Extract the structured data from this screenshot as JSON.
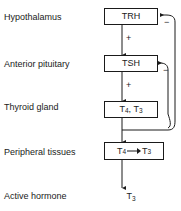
{
  "diagram": {
    "type": "flowchart",
    "rows": [
      {
        "label": "Hypothalamus",
        "node": "TRH"
      },
      {
        "label": "Anterior pituitary",
        "node": "TSH"
      },
      {
        "label": "Thyroid gland",
        "node": "T4, T3"
      },
      {
        "label": "Peripheral tissues",
        "node": "T4 → T3"
      },
      {
        "label": "Active hormone",
        "node": "T3"
      }
    ],
    "labels": {
      "hypothalamus": "Hypothalamus",
      "anterior_pituitary": "Anterior pituitary",
      "thyroid_gland": "Thyroid gland",
      "peripheral_tissues": "Peripheral tissues",
      "active_hormone": "Active hormone"
    },
    "nodes": {
      "trh": "TRH",
      "tsh": "TSH",
      "thyroid_t4": "T",
      "thyroid_t4_sub": "4",
      "thyroid_comma": ", T",
      "thyroid_t3_sub": "3",
      "peripheral_t4": "T",
      "peripheral_t4_sub": "4",
      "peripheral_t3": "T",
      "peripheral_t3_sub": "3",
      "active_t": "T",
      "active_sub": "3"
    },
    "signs": {
      "trh_to_tsh": "+",
      "tsh_to_thyroid": "+",
      "feedback_trh": "−",
      "feedback_tsh": "−"
    },
    "colors": {
      "stroke": "#1a1a1a",
      "text": "#1a1a1a",
      "background": "#ffffff"
    }
  }
}
